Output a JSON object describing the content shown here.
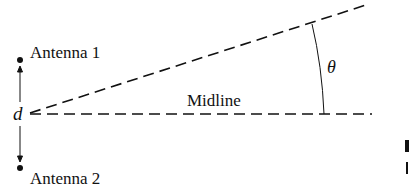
{
  "diagram": {
    "labels": {
      "antenna1": "Antenna 1",
      "antenna2": "Antenna 2",
      "separation": "d",
      "midline": "Midline",
      "angle": "θ"
    },
    "colors": {
      "ink": "#111111",
      "background": "#ffffff"
    }
  }
}
